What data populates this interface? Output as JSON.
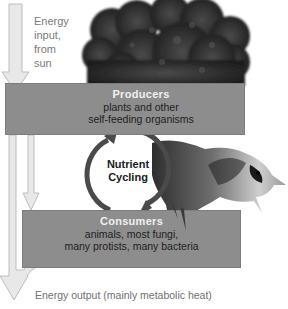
{
  "diagram": {
    "energy_input": {
      "lines": [
        "Energy",
        "input,",
        "from",
        "sun"
      ]
    },
    "producers": {
      "title": "Producers",
      "desc_line1": "plants and other",
      "desc_line2": "self-feeding organisms"
    },
    "nutrient_cycling": {
      "line1": "Nutrient",
      "line2": "Cycling"
    },
    "consumers": {
      "title": "Consumers",
      "desc_line1": "animals, most fungi,",
      "desc_line2": "many protists, many bacteria"
    },
    "energy_output": {
      "label": "Energy output (mainly metabolic heat)"
    },
    "images": {
      "tree": "tree-photo",
      "bird": "blue-jay-photo"
    },
    "colors": {
      "box_fill": "#8d8d8d",
      "box_title": "#f0f0f0",
      "arrow_fill": "#e6e6e6",
      "arrow_stroke": "#bdbdbd",
      "cycle_arrow": "#4a4a4a",
      "tree_dark": "#2a2a2a"
    }
  }
}
